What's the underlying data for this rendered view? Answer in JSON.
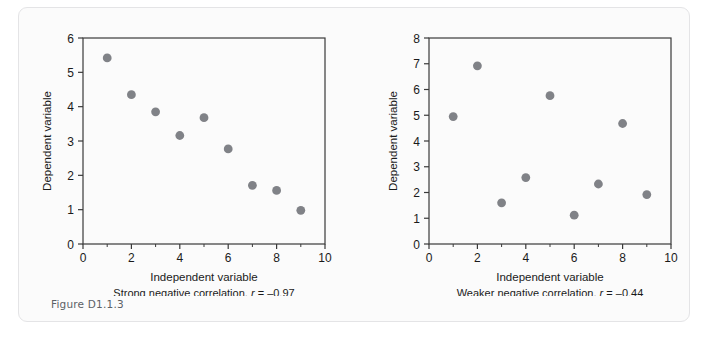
{
  "figure": {
    "background_color": "#fbfbfb",
    "border_color": "#e4e4e6",
    "marker_color": "#808287",
    "axis_color": "#3a3a3a",
    "text_color": "#1a1a1a"
  },
  "panels": [
    {
      "figure_label": "Figure D1.1.3",
      "caption": "Strong negative correlation, r = –0.97",
      "caption_prefix": "Strong negative correlation, ",
      "caption_stat_symbol": "r",
      "caption_stat_value": " = –0.97",
      "chart_data": {
        "type": "scatter",
        "title": "",
        "xlabel": "Independent variable",
        "ylabel": "Dependent variable",
        "xlim": [
          0,
          10
        ],
        "ylim": [
          0,
          6
        ],
        "xticks": [
          0,
          2,
          4,
          6,
          8,
          10
        ],
        "yticks": [
          0,
          1,
          2,
          3,
          4,
          5,
          6
        ],
        "xminorticks": [
          1,
          3,
          5,
          7,
          9
        ],
        "grid": false,
        "legend": "none",
        "x": [
          1,
          2,
          3,
          4,
          5,
          6,
          7,
          8,
          9
        ],
        "y": [
          5.42,
          4.35,
          3.85,
          3.16,
          3.68,
          2.77,
          1.71,
          1.56,
          0.98
        ],
        "correlation_r": -0.97
      }
    },
    {
      "figure_label": "Figure D1.1.4",
      "caption": "Weaker negative correlation, r = –0.44",
      "caption_prefix": "Weaker negative correlation, ",
      "caption_stat_symbol": "r",
      "caption_stat_value": " = –0.44",
      "chart_data": {
        "type": "scatter",
        "title": "",
        "xlabel": "Independent variable",
        "ylabel": "Dependent variable",
        "xlim": [
          0,
          10
        ],
        "ylim": [
          0,
          8
        ],
        "xticks": [
          0,
          2,
          4,
          6,
          8,
          10
        ],
        "yticks": [
          0,
          1,
          2,
          3,
          4,
          5,
          6,
          7,
          8
        ],
        "xminorticks": [
          1,
          3,
          5,
          7,
          9
        ],
        "grid": false,
        "legend": "none",
        "x": [
          1,
          2,
          3,
          4,
          5,
          6,
          7,
          8,
          9
        ],
        "y": [
          4.95,
          6.92,
          1.6,
          2.58,
          5.76,
          1.12,
          2.33,
          4.68,
          1.92
        ],
        "correlation_r": -0.44
      }
    }
  ]
}
